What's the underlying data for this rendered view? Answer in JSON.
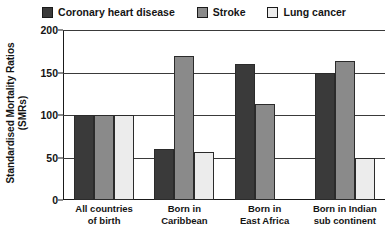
{
  "chart_data": {
    "type": "bar",
    "title": "",
    "xlabel": "",
    "ylabel": "Standardised Mortality Ratios (SMRs)",
    "ylim": [
      0,
      200
    ],
    "yticks": [
      0,
      50,
      100,
      150,
      200
    ],
    "grid": true,
    "legend_position": "top",
    "categories": [
      "All countries of birth",
      "Born in Caribbean",
      "Born in East Africa",
      "Born in Indian sub continent"
    ],
    "series": [
      {
        "name": "Coronary heart disease",
        "color": "#3a3a3a",
        "values": [
          100,
          60,
          160,
          150
        ]
      },
      {
        "name": "Stroke",
        "color": "#8a8a8a",
        "values": [
          100,
          170,
          113,
          163
        ]
      },
      {
        "name": "Lung cancer",
        "color": "#ececec",
        "values": [
          100,
          57,
          null,
          49
        ]
      }
    ]
  },
  "legend": {
    "items": [
      {
        "label": "Coronary heart disease",
        "color": "#3a3a3a"
      },
      {
        "label": "Stroke",
        "color": "#8a8a8a"
      },
      {
        "label": "Lung cancer",
        "color": "#ececec"
      }
    ]
  },
  "yaxis": {
    "title_line1": "Standardised Mortality Ratios",
    "title_line2": "(SMRs)",
    "ticks": [
      "200",
      "150",
      "100",
      "50",
      "0"
    ]
  },
  "xaxis": {
    "labels": [
      {
        "line1": "All countries",
        "line2": "of birth"
      },
      {
        "line1": "Born in",
        "line2": "Caribbean"
      },
      {
        "line1": "Born in",
        "line2": "East Africa"
      },
      {
        "line1": "Born in Indian",
        "line2": "sub continent"
      }
    ]
  }
}
